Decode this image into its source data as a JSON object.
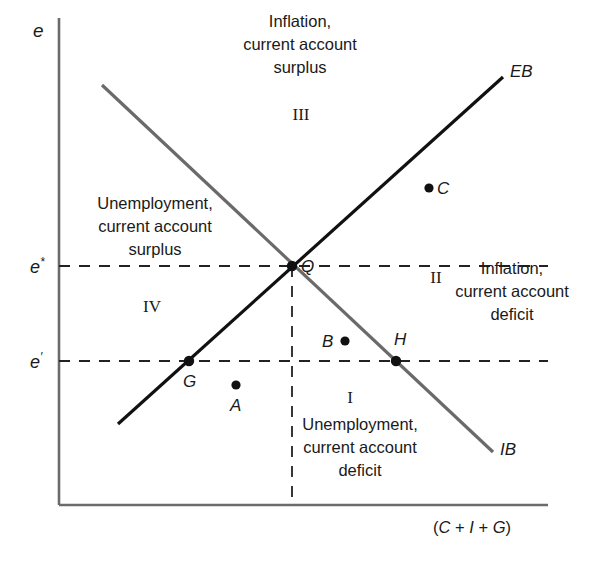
{
  "figure": {
    "axes": {
      "y_axis_label": "e",
      "x_axis_label_parts": [
        "(",
        "C",
        " + ",
        "I",
        " + ",
        "G",
        ")"
      ],
      "x_axis_label_text": "(C + I + G)",
      "y_ticks": [
        {
          "id": "e-star",
          "label": "e*",
          "base": "e",
          "sup": "*",
          "y": 266
        },
        {
          "id": "e-prime",
          "label": "e′",
          "base": "e",
          "sup": "′",
          "y": 361
        }
      ]
    },
    "curves": [
      {
        "id": "EB",
        "label": "EB",
        "description": "external balance schedule, upward sloping",
        "color": "#111111",
        "x1": 118,
        "y1": 424,
        "x2": 503,
        "y2": 77,
        "label_x": 510,
        "label_y": 62
      },
      {
        "id": "IB",
        "label": "IB",
        "description": "internal balance schedule, downward sloping",
        "color": "#666666",
        "x1": 102,
        "y1": 85,
        "x2": 493,
        "y2": 452,
        "label_x": 500,
        "label_y": 440
      }
    ],
    "points": [
      {
        "id": "Q",
        "label": "Q",
        "x": 292,
        "y": 266,
        "label_x": 301,
        "label_y": 257
      },
      {
        "id": "C",
        "label": "C",
        "x": 429,
        "y": 188,
        "label_x": 437,
        "label_y": 179
      },
      {
        "id": "B",
        "label": "B",
        "x": 345,
        "y": 341,
        "label_x": 322,
        "label_y": 332
      },
      {
        "id": "H",
        "label": "H",
        "x": 396,
        "y": 361,
        "label_x": 394,
        "label_y": 330
      },
      {
        "id": "G",
        "label": "G",
        "x": 189,
        "y": 361,
        "label_x": 183,
        "label_y": 372
      },
      {
        "id": "A",
        "label": "A",
        "x": 236,
        "y": 385,
        "label_x": 230,
        "label_y": 396
      }
    ],
    "quadrants": [
      {
        "id": "I",
        "numeral": "I",
        "numeral_x": 350,
        "numeral_y": 396,
        "text": "Unemployment,\ncurrent account\ndeficit",
        "text_x": 360,
        "text_y": 421
      },
      {
        "id": "II",
        "numeral": "II",
        "numeral_x": 436,
        "numeral_y": 277,
        "text": "Inflation,\ncurrent account\ndeficit",
        "text_x": 512,
        "text_y": 274
      },
      {
        "id": "III",
        "numeral": "III",
        "numeral_x": 301,
        "numeral_y": 115,
        "text": "Inflation,\ncurrent account\nsurplus",
        "text_x": 300,
        "text_y": 27
      },
      {
        "id": "IV",
        "numeral": "IV",
        "numeral_x": 152,
        "numeral_y": 306,
        "text": "Unemployment,\ncurrent account\nsurplus",
        "text_x": 152,
        "text_y": 209
      }
    ],
    "guides": {
      "e_star_dashed_y": 266,
      "e_prime_dashed_y": 361,
      "vertical_dashed_x": 292,
      "dash_color": "#222222"
    },
    "colors": {
      "axis": "#6b6b6b",
      "eb_line": "#111111",
      "ib_line": "#6a6a6a",
      "text": "#1a1a1a",
      "background": "#ffffff"
    }
  }
}
